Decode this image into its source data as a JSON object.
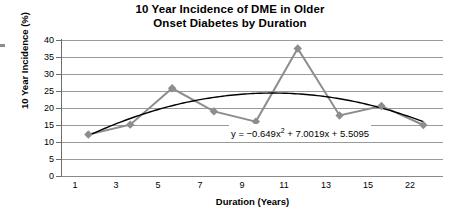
{
  "chart_data": {
    "type": "line",
    "title": "10 Year Incidence of DME in Older Onset Diabetes by Duration",
    "title_lines": [
      "10 Year Incidence of DME in Older",
      "Onset Diabetes by Duration"
    ],
    "xlabel": "Duration (Years)",
    "ylabel": "10 Year Incidence (%)",
    "categories": [
      "1",
      "3",
      "5",
      "7",
      "9",
      "11",
      "13",
      "15",
      "22"
    ],
    "values": [
      12.2,
      15.1,
      25.8,
      19.0,
      16.0,
      37.5,
      17.8,
      20.6,
      15.0
    ],
    "ylim": [
      0,
      40
    ],
    "ytick_labels": [
      "0",
      "5",
      "10",
      "15",
      "20",
      "25",
      "30",
      "35",
      "40"
    ],
    "ytick_values": [
      0,
      5,
      10,
      15,
      20,
      25,
      30,
      35,
      40
    ],
    "grid": true,
    "legend": "none",
    "series": [
      {
        "name": "10 Year Incidence",
        "color": "#8d8d8d",
        "marker": "diamond",
        "values": [
          12.2,
          15.1,
          25.8,
          19.0,
          16.0,
          37.5,
          17.8,
          20.6,
          15.0
        ]
      },
      {
        "name": "Polynomial trendline (order 2)",
        "color": "#000000",
        "marker": "none",
        "equation_coefficients": {
          "a": -0.649,
          "b": 7.0019,
          "c": 5.5095
        }
      }
    ],
    "annotations": [
      {
        "name": "trendline-equation",
        "text": "y = −0.649x² + 7.0019x + 5.5095",
        "text_prefix": "y = −0.649x",
        "text_exponent": "2",
        "text_suffix": " + 7.0019x + 5.5095"
      }
    ]
  },
  "axes": {
    "y_labels": [
      "40",
      "35",
      "30",
      "25",
      "20",
      "15",
      "10",
      "5",
      "0"
    ],
    "x_labels": [
      "1",
      "3",
      "5",
      "7",
      "9",
      "11",
      "13",
      "15",
      "22"
    ]
  },
  "colors": {
    "series": "#8d8d8d",
    "trendline": "#000000",
    "gridline": "#9a9a9a",
    "axis": "#6e6e6e",
    "background": "#ffffff",
    "text": "#000000"
  }
}
